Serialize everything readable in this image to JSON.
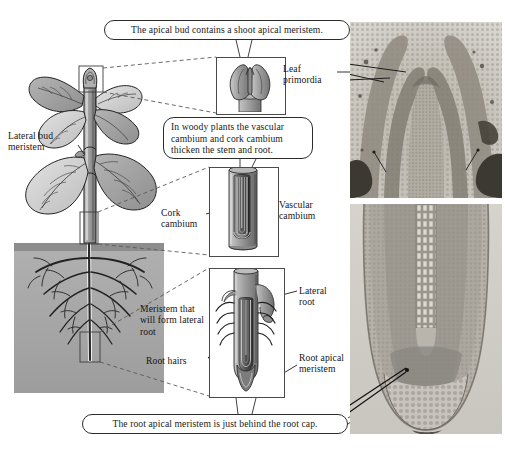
{
  "figure": {
    "background_color": "#ffffff",
    "ink_color": "#1a1a1a"
  },
  "callouts": [
    {
      "id": "apical-bud",
      "text": "The apical bud contains a shoot apical meristem."
    },
    {
      "id": "woody-cambium",
      "text": "In woody plants the vascular cambium and cork cambium thicken the stem and root."
    },
    {
      "id": "root-cap",
      "text": "The root apical meristem is just behind the root cap."
    }
  ],
  "labels": {
    "lateral_bud_meristem": "Lateral bud meristem",
    "leaf_primordia": "Leaf primordia",
    "cork_cambium": "Cork cambium",
    "vascular_cambium": "Vascular cambium",
    "meristem_lateral_root": "Meristem that will form lateral root",
    "root_hairs": "Root hairs",
    "lateral_root": "Lateral root",
    "root_apical_meristem": "Root apical meristem"
  },
  "illustration": {
    "plant_name": "whole-plant-diagram",
    "soil_color": "#a8a8a8",
    "leaf_light": "#d4d4d4",
    "leaf_dark": "#9a9a9a",
    "stem_color": "#8c8c8c",
    "outline_color": "#2b2b2b"
  },
  "details": [
    {
      "id": "apical-bud-detail",
      "caption": "apical bud cutaway"
    },
    {
      "id": "stem-cambium-detail",
      "caption": "woody stem cutaway"
    },
    {
      "id": "root-tip-detail",
      "caption": "root tip cutaway"
    }
  ],
  "micrographs": [
    {
      "id": "shoot-apical-meristem-micrograph",
      "caption": "shoot apical meristem longitudinal section"
    },
    {
      "id": "root-apical-meristem-micrograph",
      "caption": "root tip longitudinal section"
    }
  ]
}
